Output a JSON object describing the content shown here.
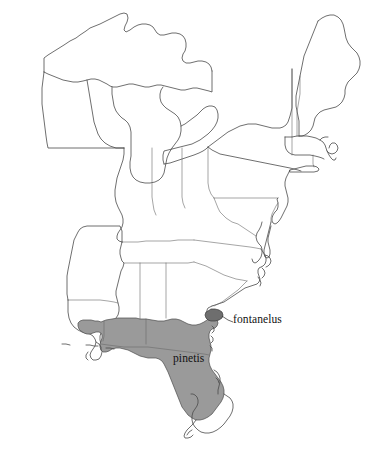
{
  "figure": {
    "type": "distribution-map",
    "region": "Eastern United States",
    "background_color": "#ffffff",
    "outline_color": "#4a4a4a",
    "shade_color": "#9a9a9a",
    "marker_color": "#6e6e6e",
    "label_color": "#111111",
    "width": 379,
    "height": 464
  },
  "labels": [
    {
      "id": "fontanelus",
      "text": "fontanelus",
      "has_leader_line": true,
      "marker": "coastal-georgia-blob"
    },
    {
      "id": "pinetis",
      "text": "pinetis",
      "has_leader_line": false,
      "marker": "gulf-coast-florida-shading"
    }
  ],
  "range_shading": {
    "taxon": "pinetis",
    "description": "Gulf Coast and Florida shaded range",
    "fill": "#9a9a9a"
  },
  "range_marker": {
    "taxon": "fontanelus",
    "description": "Small isolated population on the Georgia coast",
    "fill": "#6e6e6e"
  }
}
